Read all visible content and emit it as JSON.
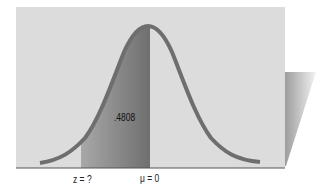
{
  "diagram": {
    "type": "normal-distribution",
    "shaded_area_label": ".4808",
    "x_labels": {
      "z": "z = ?",
      "mu": "μ = 0"
    },
    "colors": {
      "panel": "#dcdcdc",
      "shade": "#8a8a8a",
      "curve": "#6e6e6e",
      "baseline": "#555555"
    }
  }
}
